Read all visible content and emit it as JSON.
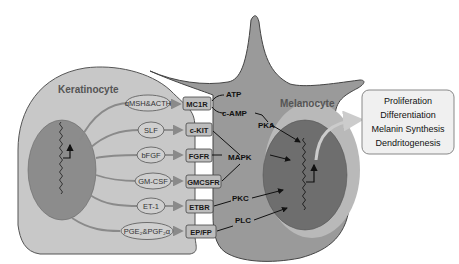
{
  "diagram": {
    "cells": {
      "keratinocyte": {
        "label": "Keratinocyte",
        "fill": "#c8c8c8",
        "nucleus_fill": "#8c8c8c"
      },
      "melanocyte": {
        "label": "Melanocyte",
        "fill": "#9a9a9a",
        "nucleus_fill": "#6e6e6e",
        "nucleus_rim": "#b9b9b9"
      }
    },
    "ligands": [
      {
        "id": "amsh_acth",
        "label": "αMSH&ACTH"
      },
      {
        "id": "slf",
        "label": "SLF"
      },
      {
        "id": "bfgf",
        "label": "bFGF"
      },
      {
        "id": "gm_csf",
        "label": "GM-CSF"
      },
      {
        "id": "et1",
        "label": "ET-1"
      },
      {
        "id": "pge2_pgf2a",
        "label": "PGE₂&PGF₂α"
      }
    ],
    "receptors": [
      {
        "id": "mc1r",
        "label": "MC1R"
      },
      {
        "id": "ckit",
        "label": "c-KIT"
      },
      {
        "id": "fgfr",
        "label": "FGFR"
      },
      {
        "id": "gmcsfr",
        "label": "GMCSFR"
      },
      {
        "id": "etbr",
        "label": "ETBR"
      },
      {
        "id": "epfp",
        "label": "EP/FP"
      }
    ],
    "signals": [
      {
        "id": "atp",
        "label": "ATP"
      },
      {
        "id": "camp",
        "label": "c-AMP"
      },
      {
        "id": "pka",
        "label": "PKA"
      },
      {
        "id": "mapk",
        "label": "MAPK"
      },
      {
        "id": "pkc",
        "label": "PKC"
      },
      {
        "id": "plc",
        "label": "PLC"
      }
    ],
    "outcomes": {
      "items": [
        "Proliferation",
        "Differentiation",
        "Melanin Synthesis",
        "Dendritogenesis"
      ],
      "box_fill": "#f0f0f0"
    },
    "colors": {
      "arrow": "#8a8a8a",
      "signal_line": "#111111",
      "receptor_fill": "#bdbdbd",
      "ligand_fill": "#cfcfcf"
    }
  }
}
